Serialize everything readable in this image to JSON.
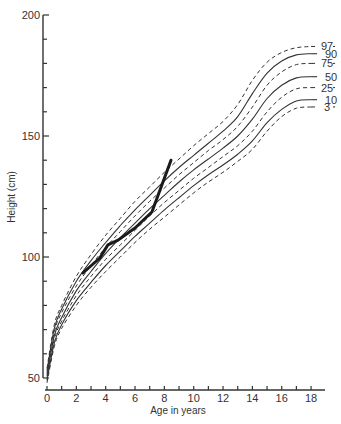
{
  "chart_data": {
    "type": "line",
    "title": "",
    "xlabel": "Age in years",
    "ylabel": "Height (cm)",
    "xlim": [
      0,
      19
    ],
    "ylim": [
      50,
      200
    ],
    "x_ticks": [
      0,
      2,
      4,
      6,
      8,
      10,
      12,
      14,
      16,
      18
    ],
    "x_minor_ticks": [
      1,
      3,
      5,
      7,
      9,
      11,
      13,
      15,
      17
    ],
    "y_ticks": [
      50,
      100,
      150,
      200
    ],
    "y_minor_step": 10,
    "grid": false,
    "legend_position": "inline-right",
    "x": [
      0,
      0.5,
      1,
      2,
      3,
      4,
      5,
      6,
      7,
      8,
      9,
      10,
      11,
      12,
      13,
      14,
      15,
      16,
      17,
      18
    ],
    "series": [
      {
        "name": "97",
        "style": "dashed",
        "values": [
          54,
          72,
          80,
          92,
          101,
          109,
          116,
          123,
          129,
          135,
          140.5,
          146,
          151,
          156,
          163,
          173,
          180.5,
          184.5,
          186.5,
          187
        ]
      },
      {
        "name": "90",
        "style": "solid",
        "values": [
          53,
          70.5,
          78.5,
          90,
          98.5,
          106,
          113,
          119.5,
          125.5,
          131.5,
          137,
          142,
          147,
          152,
          158,
          167.5,
          176,
          181,
          183.5,
          184
        ]
      },
      {
        "name": "75",
        "style": "dashed",
        "values": [
          52,
          69,
          77,
          88,
          96.5,
          104,
          110.5,
          117,
          123,
          128.5,
          134,
          139,
          144,
          148.5,
          154,
          162,
          171,
          176.5,
          179.5,
          180
        ]
      },
      {
        "name": "50",
        "style": "solid",
        "values": [
          51,
          67.5,
          75,
          86,
          94,
          101.5,
          108,
          114,
          120,
          125.5,
          131,
          136,
          140.5,
          145,
          150,
          157,
          165.5,
          171,
          174,
          174.5
        ]
      },
      {
        "name": "25",
        "style": "dashed",
        "values": [
          50,
          66,
          73.5,
          84,
          92,
          99,
          105,
          111,
          117,
          122.5,
          127.5,
          132.5,
          137,
          141.5,
          146,
          152,
          160,
          166,
          169.5,
          170
        ]
      },
      {
        "name": "10",
        "style": "solid",
        "values": [
          49,
          64.5,
          72,
          82,
          89.5,
          96.5,
          102.5,
          108.5,
          114,
          119.5,
          124.5,
          129.5,
          134,
          138,
          142.5,
          148,
          155.5,
          161,
          164.5,
          165
        ]
      },
      {
        "name": "3",
        "style": "dashed",
        "values": [
          48,
          63,
          70.5,
          80,
          87.5,
          94,
          100,
          106,
          111.5,
          116.5,
          121.5,
          126.5,
          131,
          135,
          139.5,
          144.5,
          152,
          158,
          161.5,
          162
        ]
      }
    ],
    "patient": {
      "name": "Patient height",
      "style": "thick-solid",
      "x": [
        2.45,
        3.6,
        4.15,
        4.85,
        6.0,
        7.15,
        8.45
      ],
      "y": [
        93.4,
        99.6,
        105,
        107,
        112,
        118.6,
        140
      ]
    }
  },
  "axes": {
    "x_title": "Age in years",
    "y_title": "Height (cm)"
  },
  "colors": {
    "line": "#333333",
    "patient": "#1a1a1a",
    "background": "#ffffff"
  }
}
